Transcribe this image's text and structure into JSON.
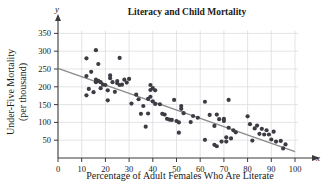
{
  "chart_data": {
    "type": "scatter",
    "title": "Literacy and Child Mortality",
    "xlabel": "Percentage of Adult Females Who Are Literate",
    "ylabel_line1": "Under-Five Mortality",
    "ylabel_line2": "(per thousand)",
    "x_axis_symbol": "x",
    "y_axis_symbol": "y",
    "xlim": [
      0,
      100
    ],
    "ylim": [
      0,
      375
    ],
    "xticks": [
      0,
      10,
      20,
      30,
      40,
      50,
      60,
      70,
      80,
      90,
      100
    ],
    "yticks": [
      50,
      100,
      150,
      200,
      250,
      300,
      350
    ],
    "grid": true,
    "legend": "none",
    "point_color": "#3c3c44",
    "trendline_color": "#8a8a8a",
    "grid_color": "#d8d8dc",
    "axis_color": "#3a3a3a",
    "trendline": {
      "label": "least-squares regression line",
      "x_start": 0,
      "y_start": 252,
      "x_end": 100,
      "y_end": 18
    },
    "points": [
      [
        12,
        280
      ],
      [
        12,
        230
      ],
      [
        12,
        176
      ],
      [
        13,
        194
      ],
      [
        14,
        242
      ],
      [
        15,
        185
      ],
      [
        16,
        303
      ],
      [
        16,
        213
      ],
      [
        16,
        220
      ],
      [
        17,
        217
      ],
      [
        17,
        264
      ],
      [
        18,
        213
      ],
      [
        18,
        196
      ],
      [
        19,
        206
      ],
      [
        20,
        205
      ],
      [
        21,
        162
      ],
      [
        21,
        190
      ],
      [
        22,
        232
      ],
      [
        22,
        224
      ],
      [
        23,
        213
      ],
      [
        24,
        186
      ],
      [
        25,
        216
      ],
      [
        25,
        210
      ],
      [
        26,
        281
      ],
      [
        26,
        205
      ],
      [
        27,
        206
      ],
      [
        28,
        220
      ],
      [
        29,
        212
      ],
      [
        30,
        222
      ],
      [
        31,
        153
      ],
      [
        33,
        178
      ],
      [
        34,
        165
      ],
      [
        35,
        124
      ],
      [
        36,
        146
      ],
      [
        37,
        88
      ],
      [
        38,
        166
      ],
      [
        38,
        125
      ],
      [
        39,
        205
      ],
      [
        39,
        191
      ],
      [
        39,
        172
      ],
      [
        40,
        196
      ],
      [
        40,
        159
      ],
      [
        41,
        190
      ],
      [
        41,
        152
      ],
      [
        43,
        151
      ],
      [
        44,
        124
      ],
      [
        45,
        122
      ],
      [
        46,
        110
      ],
      [
        47,
        108
      ],
      [
        48,
        107
      ],
      [
        49,
        163
      ],
      [
        50,
        104
      ],
      [
        51,
        100
      ],
      [
        51,
        71
      ],
      [
        52,
        146
      ],
      [
        52,
        138
      ],
      [
        53,
        126
      ],
      [
        56,
        101
      ],
      [
        57,
        118
      ],
      [
        59,
        113
      ],
      [
        62,
        158
      ],
      [
        62,
        51
      ],
      [
        64,
        121
      ],
      [
        66,
        37
      ],
      [
        66,
        90
      ],
      [
        67,
        33
      ],
      [
        67,
        122
      ],
      [
        68,
        109
      ],
      [
        69,
        46
      ],
      [
        70,
        104
      ],
      [
        70,
        110
      ],
      [
        71,
        58
      ],
      [
        71,
        46
      ],
      [
        72,
        85
      ],
      [
        72,
        163
      ],
      [
        73,
        55
      ],
      [
        74,
        78
      ],
      [
        75,
        72
      ],
      [
        80,
        117
      ],
      [
        81,
        95
      ],
      [
        82,
        49
      ],
      [
        83,
        83
      ],
      [
        84,
        91
      ],
      [
        85,
        68
      ],
      [
        86,
        82
      ],
      [
        87,
        66
      ],
      [
        88,
        78
      ],
      [
        89,
        66
      ],
      [
        90,
        52
      ],
      [
        91,
        74
      ],
      [
        92,
        46
      ],
      [
        94,
        48
      ],
      [
        95,
        27
      ],
      [
        96,
        38
      ]
    ]
  }
}
